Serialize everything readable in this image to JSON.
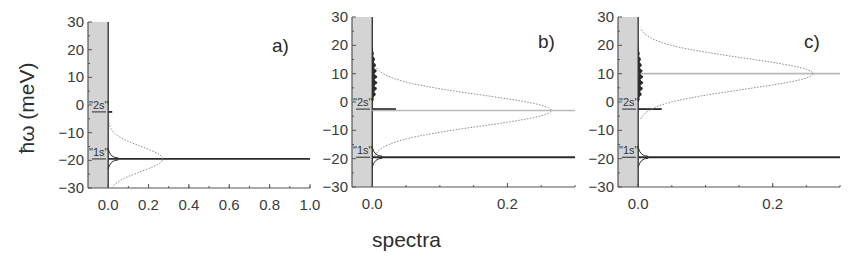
{
  "figure": {
    "xlabel": "spectra",
    "ylabel": "ħω (meV)",
    "colors": {
      "axis": "#555555",
      "shade": "#d4d4d4",
      "dark_line": "#2b2b2b",
      "light_line": "#b9b9b9",
      "dotted": "#8a8a8a"
    }
  },
  "chart_data": [
    {
      "type": "line",
      "panel": "a)",
      "title": "",
      "xlabel": "spectra",
      "ylabel": "ħω (meV)",
      "xlim": [
        -0.1,
        1.0
      ],
      "ylim": [
        -30,
        30
      ],
      "xticks": [
        "0.0",
        "0.2",
        "0.4",
        "0.6",
        "0.8",
        "1.0"
      ],
      "yticks": [
        "30",
        "20",
        "10",
        "0",
        "-10",
        "-20",
        "-30"
      ],
      "grid": false,
      "shaded_region": {
        "x": [
          -0.1,
          0.0
        ],
        "y": [
          -30,
          30
        ]
      },
      "annotations": [
        {
          "text": "\"2s\"",
          "y": -2.5
        },
        {
          "text": "\"1s\"",
          "y": -19.5
        }
      ],
      "series": [
        {
          "name": "1s resonance line",
          "style": "solid-dark",
          "y": -19.5,
          "x_range": [
            0.0,
            1.0
          ]
        },
        {
          "name": "2s marker",
          "style": "solid-dark",
          "y": -2.5,
          "x_range": [
            0.0,
            0.02
          ]
        },
        {
          "name": "gaussian pulse envelope",
          "style": "dotted",
          "center_y": -19.5,
          "sigma_meV": 4.5,
          "peak_x": 0.27
        }
      ]
    },
    {
      "type": "line",
      "panel": "b)",
      "title": "",
      "xlabel": "spectra",
      "ylabel": "ħω (meV)",
      "xlim": [
        -0.03,
        0.3
      ],
      "ylim": [
        -30,
        30
      ],
      "xticks": [
        "0.0",
        "0.2"
      ],
      "yticks": [
        "30",
        "20",
        "10",
        "0",
        "-10",
        "-20",
        "-30"
      ],
      "grid": false,
      "shaded_region": {
        "x": [
          -0.03,
          0.0
        ],
        "y": [
          -30,
          30
        ]
      },
      "annotations": [
        {
          "text": "\"2s\"",
          "y": -2.5
        },
        {
          "text": "\"1s\"",
          "y": -19.5
        }
      ],
      "series": [
        {
          "name": "1s resonance line",
          "style": "solid-dark",
          "y": -19.5,
          "x_range": [
            0.0,
            0.3
          ]
        },
        {
          "name": "2s resonance line",
          "style": "solid-dark",
          "y": -2.5,
          "x_range": [
            0.0,
            0.035
          ]
        },
        {
          "name": "pulse center line",
          "style": "solid-light",
          "y": -3,
          "x_range": [
            0.0,
            0.3
          ]
        },
        {
          "name": "gaussian pulse envelope",
          "style": "dotted",
          "center_y": -3,
          "sigma_meV": 5.5,
          "peak_x": 0.265
        },
        {
          "name": "continuum absorption",
          "style": "filled-dark",
          "y_range": [
            0,
            20
          ],
          "max_x": 0.008
        }
      ]
    },
    {
      "type": "line",
      "panel": "c)",
      "title": "",
      "xlabel": "spectra",
      "ylabel": "ħω (meV)",
      "xlim": [
        -0.03,
        0.3
      ],
      "ylim": [
        -30,
        30
      ],
      "xticks": [
        "0.0",
        "0.2"
      ],
      "yticks": [
        "30",
        "20",
        "10",
        "0",
        "-10",
        "-20",
        "-30"
      ],
      "grid": false,
      "shaded_region": {
        "x": [
          -0.03,
          0.0
        ],
        "y": [
          -30,
          30
        ]
      },
      "annotations": [
        {
          "text": "\"2s\"",
          "y": -2.5
        },
        {
          "text": "\"1s\"",
          "y": -19.5
        }
      ],
      "series": [
        {
          "name": "1s resonance line",
          "style": "solid-dark",
          "y": -19.5,
          "x_range": [
            0.0,
            0.3
          ]
        },
        {
          "name": "2s resonance line",
          "style": "solid-dark",
          "y": -2.5,
          "x_range": [
            0.0,
            0.035
          ]
        },
        {
          "name": "pulse center line",
          "style": "solid-light",
          "y": 10,
          "x_range": [
            0.0,
            0.3
          ]
        },
        {
          "name": "gaussian pulse envelope",
          "style": "dotted",
          "center_y": 10,
          "sigma_meV": 5.5,
          "peak_x": 0.26
        },
        {
          "name": "continuum absorption",
          "style": "filled-dark",
          "y_range": [
            0,
            20
          ],
          "max_x": 0.008
        }
      ]
    }
  ]
}
